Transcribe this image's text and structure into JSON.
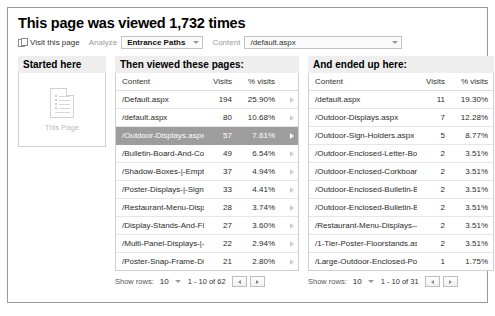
{
  "header": {
    "title": "This page was viewed 1,732 times",
    "visit_link": "Visit this page",
    "analyze_label": "Analyze",
    "analyze_value": "Entrance Paths",
    "content_label": "Content",
    "content_value": "/default.aspx"
  },
  "started": {
    "heading": "Started here",
    "page_label": "This Page"
  },
  "then": {
    "heading": "Then viewed these pages:",
    "columns": [
      "Content",
      "Visits",
      "% visits"
    ],
    "rows": [
      {
        "content": "/Default.aspx",
        "visits": "194",
        "pct": "25.90%",
        "selected": false
      },
      {
        "content": "/default.aspx",
        "visits": "80",
        "pct": "10.68%",
        "selected": false
      },
      {
        "content": "/Outdoor-Displays.aspx",
        "visits": "57",
        "pct": "7.61%",
        "selected": true
      },
      {
        "content": "/Bulletin-Board-And-Cork-B",
        "visits": "49",
        "pct": "6.54%",
        "selected": false
      },
      {
        "content": "/Shadow-Boxes-|-Empty-Wi",
        "visits": "37",
        "pct": "4.94%",
        "selected": false
      },
      {
        "content": "/Poster-Displays-|-Sign-Fra",
        "visits": "33",
        "pct": "4.41%",
        "selected": false
      },
      {
        "content": "/Restaurant-Menu-Displays",
        "visits": "28",
        "pct": "3.74%",
        "selected": false
      },
      {
        "content": "/Display-Stands-And-Floor-",
        "visits": "27",
        "pct": "3.60%",
        "selected": false
      },
      {
        "content": "/Multi-Panel-Displays-|-Pos",
        "visits": "22",
        "pct": "2.94%",
        "selected": false
      },
      {
        "content": "/Poster-Snap-Frame-Displa",
        "visits": "21",
        "pct": "2.80%",
        "selected": false
      }
    ],
    "footer": {
      "show_rows_label": "Show rows:",
      "rows_value": "10",
      "range": "1 - 10 of 62"
    }
  },
  "ended": {
    "heading": "And ended up here:",
    "columns": [
      "Content",
      "Visits",
      "% visits"
    ],
    "rows": [
      {
        "content": "/default.aspx",
        "visits": "11",
        "pct": "19.30%"
      },
      {
        "content": "/Outdoor-Displays.aspx",
        "visits": "7",
        "pct": "12.28%"
      },
      {
        "content": "/Outdoor-Sign-Holders.aspx",
        "visits": "5",
        "pct": "8.77%"
      },
      {
        "content": "/Outdoor-Enclosed-Letter-Boar",
        "visits": "2",
        "pct": "3.51%"
      },
      {
        "content": "/Outdoor-Enclosed-Corkboard-l",
        "visits": "2",
        "pct": "3.51%"
      },
      {
        "content": "/Outdoor-Enclosed-Bulletin-Boa",
        "visits": "2",
        "pct": "3.51%"
      },
      {
        "content": "/Outdoor-Enclosed-Bulletin-Boa",
        "visits": "2",
        "pct": "3.51%"
      },
      {
        "content": "/Restaurant-Menu-Displays---O",
        "visits": "2",
        "pct": "3.51%"
      },
      {
        "content": "/1-Tier-Poster-Floorstands.asp",
        "visits": "2",
        "pct": "3.51%"
      },
      {
        "content": "/Large-Outdoor-Enclosed-Poste",
        "visits": "1",
        "pct": "1.75%"
      }
    ],
    "footer": {
      "show_rows_label": "Show rows:",
      "rows_value": "10",
      "range": "1 - 10 of 31"
    }
  },
  "colors": {
    "selected_row_bg": "#9d9d9d",
    "heading_bg": "#eeeeee",
    "border": "#cfcfcf"
  }
}
